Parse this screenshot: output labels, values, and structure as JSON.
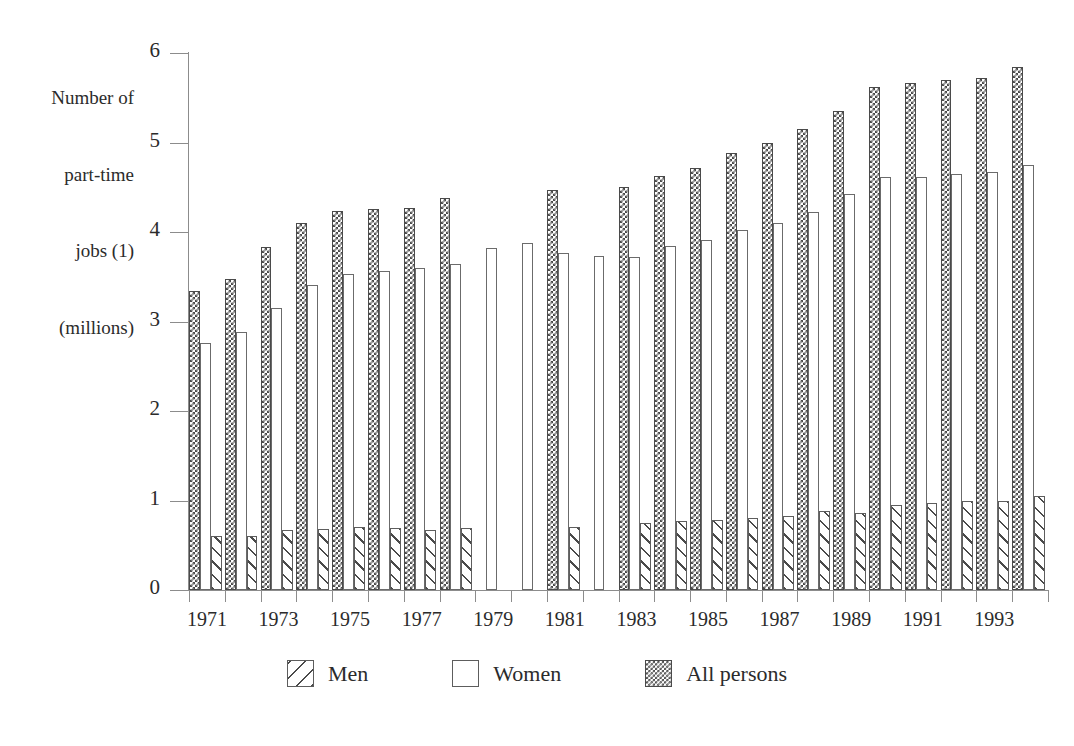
{
  "chart_data": {
    "type": "bar",
    "title": "",
    "ylabel": "Number of part-time jobs (1) (millions)",
    "ylabel_lines": [
      "Number of",
      "part-time",
      "jobs (1)",
      "(millions)"
    ],
    "xlabel": "",
    "ylim": [
      0,
      6
    ],
    "ytick_labels": [
      "0",
      "1",
      "2",
      "3",
      "4",
      "5",
      "6"
    ],
    "ytick_values": [
      0,
      1,
      2,
      3,
      4,
      5,
      6
    ],
    "grid": false,
    "legend_position": "bottom",
    "categories": [
      "1971",
      "1972",
      "1973",
      "1974",
      "1975",
      "1976",
      "1977",
      "1978",
      "1979",
      "1980",
      "1981",
      "1982",
      "1983",
      "1984",
      "1985",
      "1986",
      "1987",
      "1988",
      "1989",
      "1990",
      "1991",
      "1992",
      "1993",
      "1994"
    ],
    "xtick_labels_shown": [
      "1971",
      "1973",
      "1975",
      "1977",
      "1979",
      "1981",
      "1983",
      "1985",
      "1987",
      "1989",
      "1991",
      "1993"
    ],
    "series": [
      {
        "name": "Men",
        "pattern": "diagonal-hatch",
        "values": [
          0.6,
          0.6,
          0.67,
          0.68,
          0.7,
          0.69,
          0.67,
          0.69,
          null,
          null,
          0.7,
          null,
          0.75,
          0.77,
          0.78,
          0.8,
          0.83,
          0.88,
          0.86,
          0.95,
          0.97,
          0.99,
          1.0,
          1.05
        ]
      },
      {
        "name": "Women",
        "pattern": "solid-white",
        "values": [
          2.76,
          2.88,
          3.15,
          3.41,
          3.53,
          3.57,
          3.6,
          3.64,
          3.82,
          3.88,
          3.76,
          3.73,
          3.72,
          3.84,
          3.91,
          4.02,
          4.1,
          4.22,
          4.43,
          4.62,
          4.61,
          4.65,
          4.67,
          4.75
        ]
      },
      {
        "name": "All persons",
        "pattern": "checkerboard",
        "values": [
          3.34,
          3.47,
          3.83,
          4.1,
          4.24,
          4.26,
          4.27,
          4.38,
          null,
          null,
          4.47,
          null,
          4.5,
          4.63,
          4.72,
          4.88,
          5.0,
          5.15,
          5.35,
          5.62,
          5.66,
          5.7,
          5.72,
          5.84
        ]
      }
    ]
  },
  "legend": {
    "items": [
      {
        "label": "Men",
        "swatch": "men-hatch-swatch"
      },
      {
        "label": "Women",
        "swatch": "women-white-swatch"
      },
      {
        "label": "All persons",
        "swatch": "all-persons-checker-swatch"
      }
    ]
  },
  "colors": {
    "background": "#ffffff",
    "axis": "#8c8c8c",
    "text": "#2b2b2b",
    "pattern_ink": "#4a4a4a",
    "bar_outline": "#5d5d5d"
  }
}
